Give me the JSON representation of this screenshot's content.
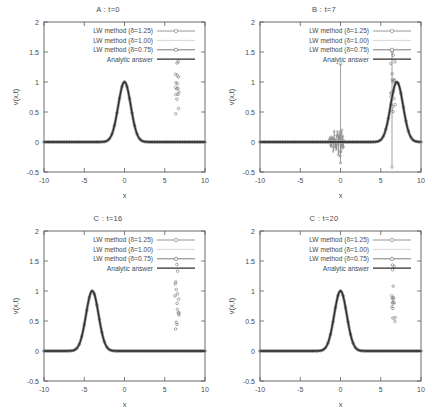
{
  "figure": {
    "background": "#ffffff",
    "panel_count": 4
  },
  "axes": {
    "xlabel": "x",
    "ylabel": "v(x,t)",
    "xticks": [
      "-10",
      "-5",
      "0",
      "5",
      "10"
    ],
    "xtick_values": [
      -10,
      -5,
      0,
      5,
      10
    ],
    "yticks": [
      "-0.5",
      "0",
      "0.5",
      "1",
      "1.5",
      "2"
    ],
    "ytick_values": [
      -0.5,
      0,
      0.5,
      1,
      1.5,
      2
    ],
    "xlim": [
      -10,
      10
    ],
    "ylim": [
      -0.5,
      2
    ]
  },
  "legend": {
    "position": "top-right-inside",
    "entries": [
      {
        "label": "LW method (δ=1.25)",
        "marker": "circle",
        "color": "#8a8a8a"
      },
      {
        "label": "LW method (δ=1.00)",
        "marker": "none",
        "color": "#d0d0d0"
      },
      {
        "label": "LW method (δ=0.75)",
        "marker": "circle",
        "color": "#6e6e6e"
      },
      {
        "label": "Analytic answer",
        "marker": "none",
        "color": "#2b2b2b"
      }
    ]
  },
  "colors": {
    "axis": "#5a5a5a",
    "analytic": "#2b2b2b",
    "lw_125": "#8a8a8a",
    "lw_100": "#cfcfcf",
    "lw_075": "#707070",
    "text": "#4a4a4a"
  },
  "chart_data": [
    {
      "type": "line",
      "panel_id": "A",
      "title": "A : t=0",
      "xlabel": "x",
      "ylabel": "v(x,t)",
      "xlim": [
        -10,
        10
      ],
      "ylim": [
        -0.5,
        2
      ],
      "grid": false,
      "legend": [
        "LW method (δ=1.25)",
        "LW method (δ=1.00)",
        "LW method (δ=0.75)",
        "Analytic answer"
      ],
      "pulse": {
        "center": 0.0,
        "amplitude": 1.0,
        "width": 1.1
      },
      "spikes": [],
      "noise": null,
      "series": [
        {
          "name": "Analytic answer",
          "shape": "gaussian",
          "center": 0.0,
          "amplitude": 1.0,
          "width": 1.1
        },
        {
          "name": "LW method (δ=1.25)",
          "shape": "gaussian",
          "center": 0.0,
          "amplitude": 1.0,
          "width": 1.1
        },
        {
          "name": "LW method (δ=1.00)",
          "shape": "gaussian",
          "center": 0.0,
          "amplitude": 1.0,
          "width": 1.1
        },
        {
          "name": "LW method (δ=0.75)",
          "shape": "gaussian",
          "center": 0.0,
          "amplitude": 1.0,
          "width": 1.1
        }
      ]
    },
    {
      "type": "line",
      "panel_id": "B",
      "title": "B : t=7",
      "xlabel": "x",
      "ylabel": "v(x,t)",
      "xlim": [
        -10,
        10
      ],
      "ylim": [
        -0.5,
        2
      ],
      "grid": false,
      "legend": [
        "LW method (δ=1.25)",
        "LW method (δ=1.00)",
        "LW method (δ=0.75)",
        "Analytic answer"
      ],
      "pulse": {
        "center": 7.0,
        "amplitude": 1.0,
        "width": 1.1
      },
      "spikes": [
        {
          "x": 0.0,
          "top": 1.3,
          "bottom": -0.35
        },
        {
          "x": 6.4,
          "top": 1.5,
          "bottom": -0.42
        }
      ],
      "noise": {
        "x_range": [
          -1.4,
          0.4
        ],
        "amplitude": 0.28
      },
      "series": [
        {
          "name": "Analytic answer",
          "shape": "gaussian",
          "center": 7.0,
          "amplitude": 1.0,
          "width": 1.1
        },
        {
          "name": "LW method (δ=1.25)",
          "shape": "unstable",
          "center": 7.0,
          "amplitude": 1.0,
          "width": 1.1
        },
        {
          "name": "LW method (δ=1.00)",
          "shape": "gaussian",
          "center": 7.0,
          "amplitude": 1.0,
          "width": 1.1
        },
        {
          "name": "LW method (δ=0.75)",
          "shape": "gaussian",
          "center": 7.0,
          "amplitude": 1.0,
          "width": 1.1
        }
      ]
    },
    {
      "type": "line",
      "panel_id": "C",
      "title": "C : t=16",
      "xlabel": "x",
      "ylabel": "v(x,t)",
      "xlim": [
        -10,
        10
      ],
      "ylim": [
        -0.5,
        2
      ],
      "grid": false,
      "legend": [
        "LW method (δ=1.25)",
        "LW method (δ=1.00)",
        "LW method (δ=0.75)",
        "Analytic answer"
      ],
      "pulse": {
        "center": -4.0,
        "amplitude": 1.0,
        "width": 1.1
      },
      "spikes": [],
      "noise": null,
      "series": [
        {
          "name": "Analytic answer",
          "shape": "gaussian",
          "center": -4.0,
          "amplitude": 1.0,
          "width": 1.1
        },
        {
          "name": "LW method (δ=1.25)",
          "shape": "gaussian",
          "center": -4.0,
          "amplitude": 1.0,
          "width": 1.1
        },
        {
          "name": "LW method (δ=1.00)",
          "shape": "gaussian",
          "center": -4.0,
          "amplitude": 1.0,
          "width": 1.1
        },
        {
          "name": "LW method (δ=0.75)",
          "shape": "gaussian",
          "center": -4.0,
          "amplitude": 1.0,
          "width": 1.1
        }
      ]
    },
    {
      "type": "line",
      "panel_id": "D",
      "title": "C : t=20",
      "xlabel": "x",
      "ylabel": "v(x,t)",
      "xlim": [
        -10,
        10
      ],
      "ylim": [
        -0.5,
        2
      ],
      "grid": false,
      "legend": [
        "LW method (δ=1.25)",
        "LW method (δ=1.00)",
        "LW method (δ=0.75)",
        "Analytic answer"
      ],
      "pulse": {
        "center": 0.0,
        "amplitude": 1.0,
        "width": 1.1
      },
      "spikes": [],
      "noise": null,
      "series": [
        {
          "name": "Analytic answer",
          "shape": "gaussian",
          "center": 0.0,
          "amplitude": 1.0,
          "width": 1.1
        },
        {
          "name": "LW method (δ=1.25)",
          "shape": "gaussian",
          "center": 0.0,
          "amplitude": 1.0,
          "width": 1.1
        },
        {
          "name": "LW method (δ=1.00)",
          "shape": "gaussian",
          "center": 0.0,
          "amplitude": 1.0,
          "width": 1.1
        },
        {
          "name": "LW method (δ=0.75)",
          "shape": "gaussian",
          "center": 0.0,
          "amplitude": 1.0,
          "width": 1.1
        }
      ]
    }
  ]
}
